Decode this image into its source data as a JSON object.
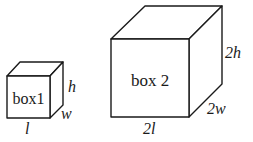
{
  "diagram": {
    "box1": {
      "label": "box1",
      "dims": {
        "length": "l",
        "width": "w",
        "height": "h"
      }
    },
    "box2": {
      "label": "box 2",
      "dims": {
        "length": "2l",
        "width": "2w",
        "height": "2h"
      }
    },
    "colors": {
      "stroke": "#1a1a1a",
      "fill": "#ffffff"
    }
  }
}
